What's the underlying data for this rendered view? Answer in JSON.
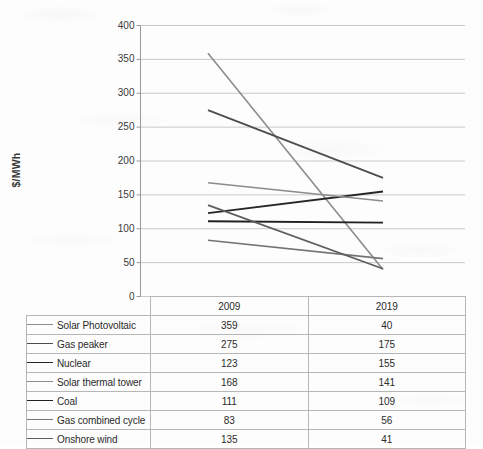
{
  "chart_data": {
    "type": "line",
    "title": "",
    "xlabel": "",
    "ylabel": "$/MWh",
    "categories": [
      "2009",
      "2019"
    ],
    "ylim": [
      0,
      400
    ],
    "ytick_step": 50,
    "yticks": [
      "400",
      "350",
      "300",
      "250",
      "200",
      "150",
      "100",
      "50",
      "0"
    ],
    "grid": true,
    "legend_position": "data-table",
    "series": [
      {
        "name": "Solar Photovoltaic",
        "values": [
          359,
          40
        ],
        "color": "#8c8c8c",
        "width": 1.6
      },
      {
        "name": "Gas peaker",
        "values": [
          275,
          175
        ],
        "color": "#4d4d4d",
        "width": 1.8
      },
      {
        "name": "Nuclear",
        "values": [
          123,
          155
        ],
        "color": "#262626",
        "width": 1.9
      },
      {
        "name": "Solar thermal tower",
        "values": [
          168,
          141
        ],
        "color": "#8c8c8c",
        "width": 1.6
      },
      {
        "name": "Coal",
        "values": [
          111,
          109
        ],
        "color": "#1f1f1f",
        "width": 1.9
      },
      {
        "name": "Gas combined cycle",
        "values": [
          83,
          56
        ],
        "color": "#737373",
        "width": 1.7
      },
      {
        "name": "Onshore wind",
        "values": [
          135,
          41
        ],
        "color": "#5e5e5e",
        "width": 1.8
      }
    ]
  },
  "table": {
    "blank_header": "",
    "columns": [
      "2009",
      "2019"
    ],
    "rows": [
      {
        "label": "Solar Photovoltaic",
        "v2009": "359",
        "v2019": "40"
      },
      {
        "label": "Gas peaker",
        "v2009": "275",
        "v2019": "175"
      },
      {
        "label": "Nuclear",
        "v2009": "123",
        "v2019": "155"
      },
      {
        "label": "Solar thermal tower",
        "v2009": "168",
        "v2019": "141"
      },
      {
        "label": "Coal",
        "v2009": "111",
        "v2019": "109"
      },
      {
        "label": "Gas combined cycle",
        "v2009": "83",
        "v2019": "56"
      },
      {
        "label": "Onshore wind",
        "v2009": "135",
        "v2019": "41"
      }
    ]
  },
  "axis": {
    "y_title": "$/MWh"
  },
  "colors": {
    "gridline": "#c8c8c8",
    "axis": "#999999",
    "table_border": "#b6b6b6",
    "text": "#2b2b2b"
  }
}
